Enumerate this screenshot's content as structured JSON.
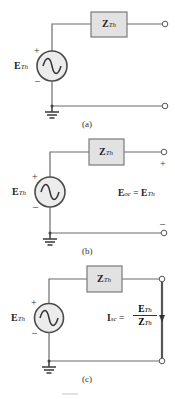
{
  "figure": {
    "panels": [
      {
        "id": "a",
        "caption": "(a)",
        "impedance": {
          "main": "Z",
          "sub": "Th"
        },
        "source": {
          "main": "E",
          "sub": "Th",
          "plus": "+",
          "minus": "–"
        }
      },
      {
        "id": "b",
        "caption": "(b)",
        "impedance": {
          "main": "Z",
          "sub": "Th"
        },
        "source": {
          "main": "E",
          "sub": "Th",
          "plus": "+",
          "minus": "–"
        },
        "terminal_plus": "+",
        "terminal_minus": "–",
        "equation": {
          "lhs_main": "E",
          "lhs_sub": "oc",
          "eq": "=",
          "rhs_main": "E",
          "rhs_sub": "Th"
        }
      },
      {
        "id": "c",
        "caption": "(c)",
        "impedance": {
          "main": "Z",
          "sub": "Th"
        },
        "source": {
          "main": "E",
          "sub": "Th",
          "plus": "+",
          "minus": "–"
        },
        "equation": {
          "lhs_main": "I",
          "lhs_sub": "sc",
          "eq": "=",
          "num_main": "E",
          "num_sub": "Th",
          "den_main": "Z",
          "den_sub": "Th"
        }
      }
    ],
    "colors": {
      "wire": "#6b6b6b",
      "box_fill": "#e2e2e2",
      "source_fill": "#ececec"
    }
  }
}
